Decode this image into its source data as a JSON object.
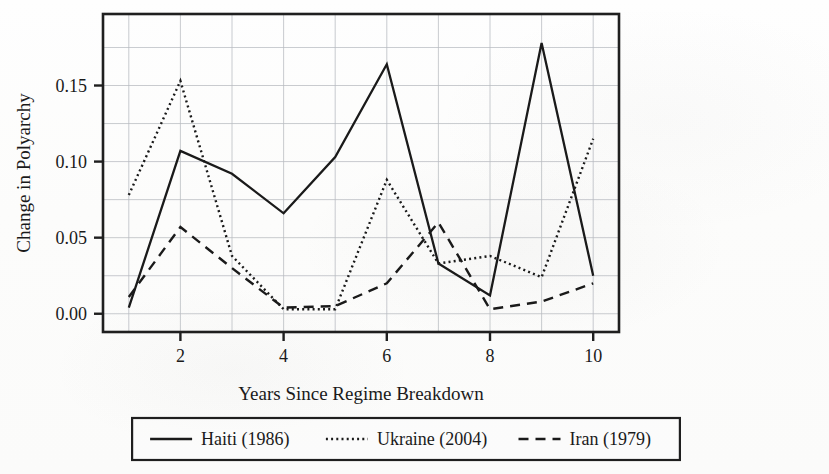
{
  "chart_data": {
    "type": "line",
    "title": "",
    "xlabel": "Years Since Regime Breakdown",
    "ylabel": "Change in Polyarchy",
    "x": [
      1,
      2,
      3,
      4,
      5,
      6,
      7,
      8,
      9,
      10
    ],
    "xlim": [
      0.5,
      10.5
    ],
    "ylim": [
      -0.012,
      0.197
    ],
    "xticks": [
      2,
      4,
      6,
      8,
      10
    ],
    "xticklabels": [
      "2",
      "4",
      "6",
      "8",
      "10"
    ],
    "yticks": [
      0.0,
      0.05,
      0.1,
      0.15
    ],
    "yticklabels": [
      "0.00",
      "0.05",
      "0.10",
      "0.15"
    ],
    "grid": true,
    "grid_color": "#b9bcc2",
    "legend_position": "below-center",
    "series": [
      {
        "name": "Haiti (1986)",
        "style": "solid",
        "color": "#1a1a1a",
        "values": [
          0.004,
          0.107,
          0.092,
          0.066,
          0.103,
          0.164,
          0.033,
          0.012,
          0.178,
          0.025
        ]
      },
      {
        "name": "Ukraine (2004)",
        "style": "dotted",
        "color": "#1a1a1a",
        "values": [
          0.078,
          0.153,
          0.038,
          0.003,
          0.003,
          0.088,
          0.033,
          0.038,
          0.024,
          0.115
        ]
      },
      {
        "name": "Iran (1979)",
        "style": "dashed",
        "color": "#1a1a1a",
        "values": [
          0.011,
          0.057,
          0.03,
          0.004,
          0.005,
          0.02,
          0.06,
          0.003,
          0.008,
          0.02
        ]
      }
    ]
  },
  "legend": {
    "entries": [
      {
        "label": "Haiti (1986)",
        "style": "solid"
      },
      {
        "label": "Ukraine (2004)",
        "style": "dotted"
      },
      {
        "label": "Iran (1979)",
        "style": "dashed"
      }
    ]
  },
  "axes": {
    "x_title": "Years Since Regime Breakdown",
    "y_title": "Change in Polyarchy"
  }
}
